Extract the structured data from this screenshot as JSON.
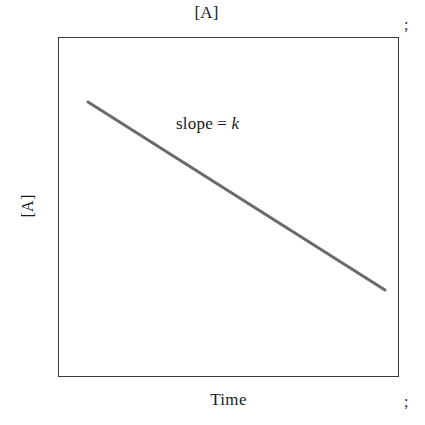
{
  "figure": {
    "title": "[A]",
    "background_color": "#ffffff",
    "frame_color": "#3a3a3a",
    "line_color": "#6a6a6a",
    "text_color": "#1a1a1a"
  },
  "annotations": {
    "slope_prefix": "slope = ",
    "slope_variable": "k"
  },
  "margin_marks": {
    "top": ";",
    "bottom": ";"
  },
  "chart_data": {
    "type": "line",
    "title": "[A]",
    "xlabel": "Time",
    "ylabel": "[A]",
    "grid": false,
    "legend": "none",
    "xlim": [
      0,
      1
    ],
    "ylim": [
      0,
      1
    ],
    "xticks": [],
    "yticks": [],
    "annotations": [
      {
        "text": "slope = k",
        "x": 0.35,
        "y": 0.75
      }
    ],
    "series": [
      {
        "name": "[A] vs Time",
        "style": "straight-line",
        "color": "#6a6a6a",
        "linewidth": 3,
        "x": [
          0.088,
          0.871
        ],
        "y": [
          0.809,
          0.256
        ],
        "x_pixels": [
          88,
          385
        ],
        "y_pixels": [
          102,
          290
        ]
      }
    ]
  }
}
